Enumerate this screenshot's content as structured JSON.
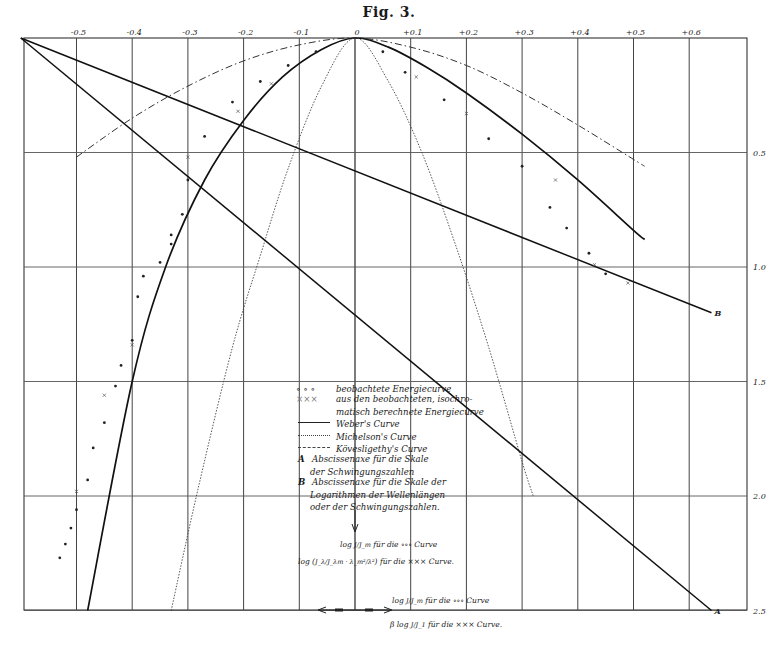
{
  "figure": {
    "title": "Fig. 3."
  },
  "chart_data": {
    "type": "line",
    "title": "Fig. 3.",
    "xlabel": "",
    "ylabel": "",
    "x_axis_position": "top",
    "y_axis_position": "right",
    "x_ticks": [
      "-0.5",
      "-0.4",
      "-0.3",
      "-0.2",
      "-0.1",
      "0",
      "+0.1",
      "+0.2",
      "+0.3",
      "+0.4",
      "+0.5",
      "+0.6"
    ],
    "x_tick_labels_printed": [
      "-0.5",
      "-0.4",
      "-0.3",
      "-0.2",
      "-0.1",
      "0",
      "+0.1",
      "+0.2",
      "+0.3",
      "+0.4",
      "+0.5",
      "+0.6"
    ],
    "y_ticks": [
      "0.5",
      "1.0",
      "1.5",
      "2.0",
      "2.5"
    ],
    "xlim": [
      -0.6,
      0.7
    ],
    "ylim": [
      2.5,
      0
    ],
    "grid": true,
    "series": [
      {
        "name": "Weber's Curve",
        "style": "solid",
        "points": [
          [
            -0.48,
            2.5
          ],
          [
            -0.4,
            1.5
          ],
          [
            -0.34,
            1.0
          ],
          [
            -0.27,
            0.62
          ],
          [
            -0.2,
            0.36
          ],
          [
            -0.13,
            0.17
          ],
          [
            -0.06,
            0.05
          ],
          [
            0,
            0
          ],
          [
            0.06,
            0.04
          ],
          [
            0.13,
            0.13
          ],
          [
            0.2,
            0.24
          ],
          [
            0.3,
            0.42
          ],
          [
            0.4,
            0.62
          ],
          [
            0.5,
            0.84
          ],
          [
            0.52,
            0.88
          ]
        ]
      },
      {
        "name": "Michelson's Curve",
        "style": "dotted",
        "points": [
          [
            -0.33,
            2.5
          ],
          [
            -0.28,
            1.95
          ],
          [
            -0.22,
            1.35
          ],
          [
            -0.17,
            0.95
          ],
          [
            -0.12,
            0.57
          ],
          [
            -0.06,
            0.21
          ],
          [
            0,
            0
          ],
          [
            0.06,
            0.19
          ],
          [
            0.12,
            0.5
          ],
          [
            0.18,
            0.9
          ],
          [
            0.24,
            1.35
          ],
          [
            0.3,
            1.85
          ],
          [
            0.32,
            2.0
          ]
        ]
      },
      {
        "name": "Kövesligethy's Curve",
        "style": "dash-dot",
        "points": [
          [
            -0.5,
            0.52
          ],
          [
            -0.4,
            0.35
          ],
          [
            -0.3,
            0.21
          ],
          [
            -0.2,
            0.1
          ],
          [
            -0.1,
            0.03
          ],
          [
            0,
            0
          ],
          [
            0.1,
            0.04
          ],
          [
            0.2,
            0.12
          ],
          [
            0.3,
            0.24
          ],
          [
            0.4,
            0.38
          ],
          [
            0.5,
            0.53
          ],
          [
            0.52,
            0.56
          ]
        ]
      },
      {
        "name": "A Abscissenaxe für die Skale der Schwingungszahlen",
        "style": "straight-line",
        "points": [
          [
            -0.6,
            0
          ],
          [
            0.64,
            2.5
          ]
        ],
        "end_label": "A"
      },
      {
        "name": "B Abscissenaxe für die Skale der Logarithmen der Wellenlängen oder der Schwingungszahlen",
        "style": "straight-line",
        "points": [
          [
            -0.6,
            0
          ],
          [
            0.64,
            1.2
          ]
        ],
        "end_label": "B"
      },
      {
        "name": "beobachtete Energiecurve",
        "style": "markers-o",
        "points": [
          [
            -0.53,
            2.27
          ],
          [
            -0.52,
            2.21
          ],
          [
            -0.51,
            2.14
          ],
          [
            -0.5,
            2.06
          ],
          [
            -0.48,
            1.93
          ],
          [
            -0.47,
            1.79
          ],
          [
            -0.45,
            1.68
          ],
          [
            -0.43,
            1.52
          ],
          [
            -0.42,
            1.43
          ],
          [
            -0.4,
            1.32
          ],
          [
            -0.39,
            1.13
          ],
          [
            -0.38,
            1.04
          ],
          [
            -0.35,
            0.98
          ],
          [
            -0.33,
            0.9
          ],
          [
            -0.33,
            0.86
          ],
          [
            -0.31,
            0.77
          ],
          [
            -0.3,
            0.62
          ],
          [
            -0.27,
            0.43
          ],
          [
            -0.22,
            0.28
          ],
          [
            -0.17,
            0.19
          ],
          [
            -0.12,
            0.12
          ],
          [
            -0.07,
            0.06
          ],
          [
            0.05,
            0.06
          ],
          [
            0.09,
            0.15
          ],
          [
            0.16,
            0.27
          ],
          [
            0.24,
            0.44
          ],
          [
            0.3,
            0.56
          ],
          [
            0.35,
            0.74
          ],
          [
            0.38,
            0.83
          ],
          [
            0.42,
            0.94
          ],
          [
            0.45,
            1.03
          ]
        ]
      },
      {
        "name": "aus den beobachteten, isochromatisch berechnete Energiecurve",
        "style": "markers-x",
        "points": [
          [
            -0.5,
            1.98
          ],
          [
            -0.45,
            1.56
          ],
          [
            -0.4,
            1.34
          ],
          [
            -0.3,
            0.52
          ],
          [
            -0.21,
            0.32
          ],
          [
            -0.15,
            0.2
          ],
          [
            0.11,
            0.17
          ],
          [
            0.2,
            0.33
          ],
          [
            0.36,
            0.62
          ],
          [
            0.43,
            0.99
          ],
          [
            0.49,
            1.07
          ]
        ]
      }
    ],
    "annotations": [
      "log J/J_m für die ∘∘∘ Curve",
      "log (J_λ/J_λm · λ_m²/λ²) für die ××× Curve",
      "log J/J_m für die ∘∘∘ Curve",
      "β log J/J_1 für die ××× Curve"
    ]
  },
  "legend": {
    "items": [
      {
        "symbol": "o o o",
        "text": "beobachtete Energiecurve"
      },
      {
        "symbol": "XXX",
        "text": "aus den beobachteten, isochro-"
      },
      {
        "symbol": "",
        "text": "matisch berechnete Energiecurve"
      },
      {
        "symbol": "solid-line",
        "text": "Weber's Curve"
      },
      {
        "symbol": "dotted-line",
        "text": "Michelson's Curve"
      },
      {
        "symbol": "dashdot-line",
        "text": "Kövesligethy's Curve"
      },
      {
        "symbol": "A",
        "text": "Abscissenaxe für die Skale"
      },
      {
        "symbol": "",
        "text": "der Schwingungszahlen"
      },
      {
        "symbol": "B",
        "text": "Abscissenaxe für die Skale der"
      },
      {
        "symbol": "",
        "text": "Logarithmen der Wellenlängen"
      },
      {
        "symbol": "",
        "text": "oder der Schwingungszahlen."
      }
    ]
  },
  "axis_annotations": {
    "a1_pre": "log",
    "a1_frac": "J/J_m",
    "a1_post": "für die ∘∘∘ Curve",
    "a2_pre": "log (",
    "a2_frac": "J_λ/J_λm · λ_m²/λ²",
    "a2_post": ") für die ××× Curve.",
    "b1_pre": "log",
    "b1_frac": "J/J_m",
    "b1_post": "für die ∘∘∘ Curve",
    "b2_pre": "β log",
    "b2_frac": "J/J_1",
    "b2_post": "für die ××× Curve."
  },
  "line_labels": {
    "A": "A",
    "B": "B"
  }
}
